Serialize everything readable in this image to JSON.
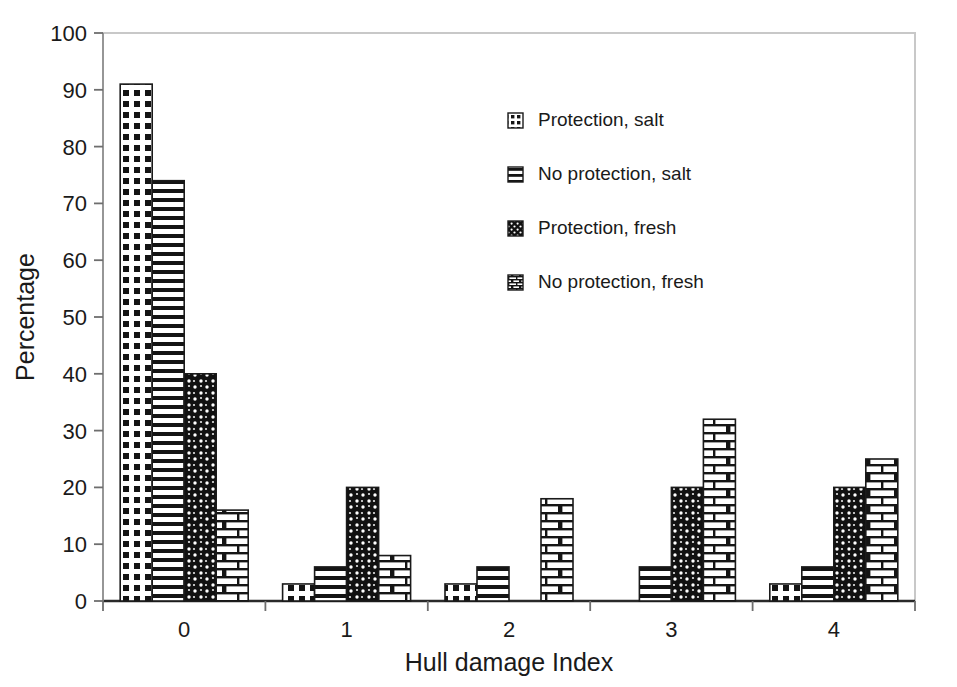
{
  "chart_data": {
    "type": "bar",
    "title": "",
    "subtitle": "",
    "xlabel": "Hull damage Index",
    "ylabel": "Percentage",
    "categories": [
      "0",
      "1",
      "2",
      "3",
      "4"
    ],
    "ylim": [
      0,
      100
    ],
    "ytick_step": 10,
    "yticks": [
      "0",
      "10",
      "20",
      "30",
      "40",
      "50",
      "60",
      "70",
      "80",
      "90",
      "100"
    ],
    "grid": false,
    "legend_position": "inside-upper-center-right",
    "series": [
      {
        "name": "Protection, salt",
        "pattern": "grid-crosshatch",
        "values": [
          91,
          3,
          3,
          0,
          3
        ]
      },
      {
        "name": "No protection, salt",
        "pattern": "horizontal-lines",
        "values": [
          74,
          6,
          6,
          6,
          6
        ]
      },
      {
        "name": "Protection, fresh",
        "pattern": "dark-speckle",
        "values": [
          40,
          20,
          0,
          20,
          20
        ]
      },
      {
        "name": "No protection, fresh",
        "pattern": "brick",
        "values": [
          16,
          8,
          18,
          32,
          25
        ]
      }
    ]
  },
  "legend": {
    "entries": [
      {
        "label": "Protection, salt"
      },
      {
        "label": "No protection, salt"
      },
      {
        "label": "Protection, fresh"
      },
      {
        "label": "No protection, fresh"
      }
    ]
  },
  "colors": {
    "ink": "#1a1a1a",
    "frame": "#c8c8c8",
    "background": "#ffffff",
    "bar_stroke": "#1a1a1a",
    "bar_fill_light": "#ffffff",
    "bar_fill_dark": "#101010"
  }
}
